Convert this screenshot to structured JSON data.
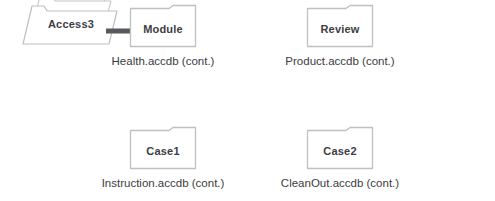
{
  "diagram": {
    "background_color": "#ffffff",
    "folder_border_color": "#bfbfc4",
    "folder_fill_color": "#ffffff",
    "label_color": "#3d3d42",
    "caption_color": "#3b3b3f",
    "arrow_color": "#58585e",
    "source": {
      "label": "Access3",
      "icon": "folder-stack-icon",
      "stack_count": 3
    },
    "connector": {
      "icon": "arrow-right-icon",
      "from": "Access3",
      "to": "Module"
    },
    "nodes": [
      {
        "id": "module",
        "label": "Module",
        "caption": "Health.accdb (cont.)",
        "icon": "folder-icon"
      },
      {
        "id": "review",
        "label": "Review",
        "caption": "Product.accdb (cont.)",
        "icon": "folder-icon"
      },
      {
        "id": "case1",
        "label": "Case1",
        "caption": "Instruction.accdb (cont.)",
        "icon": "folder-icon"
      },
      {
        "id": "case2",
        "label": "Case2",
        "caption": "CleanOut.accdb (cont.)",
        "icon": "folder-icon"
      }
    ]
  }
}
